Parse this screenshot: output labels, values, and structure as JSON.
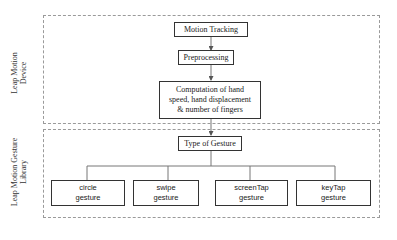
{
  "groups": {
    "device": {
      "label_line1": "Leap Motion",
      "label_line2": "Device"
    },
    "library": {
      "label_line1": "Leap Motion Gesture",
      "label_line2": "Library"
    }
  },
  "nodes": {
    "motion_tracking": "Motion Tracking",
    "preprocessing": "Preprocessing",
    "computation": {
      "line1": "Computation of hand",
      "line2": "speed, hand displacement",
      "line3": "& number of fingers"
    },
    "type_of_gesture": "Type of Gesture"
  },
  "gestures": [
    {
      "name": "circle",
      "suffix": "gesture"
    },
    {
      "name": "swipe",
      "suffix": "gesture"
    },
    {
      "name": "screenTap",
      "suffix": "gesture"
    },
    {
      "name": "keyTap",
      "suffix": "gesture"
    }
  ]
}
